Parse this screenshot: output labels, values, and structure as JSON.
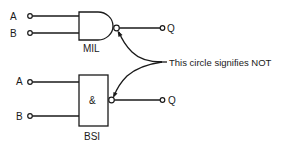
{
  "diagram": {
    "mil_gate": {
      "label": "MIL",
      "inputs": [
        "A",
        "B"
      ],
      "output": "Q"
    },
    "bsi_gate": {
      "label": "BSI",
      "symbol": "&",
      "inputs": [
        "A",
        "B"
      ],
      "output": "Q"
    },
    "annotation": "This circle signifies NOT",
    "colors": {
      "stroke": "#1a1a1a",
      "background": "#ffffff"
    }
  }
}
